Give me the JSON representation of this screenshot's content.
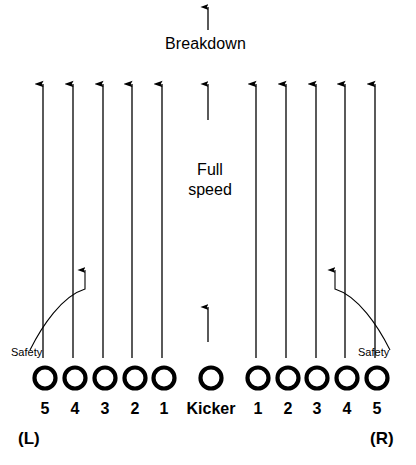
{
  "diagram": {
    "title_text": "Breakdown",
    "center_label_line1": "Full",
    "center_label_line2": "speed",
    "kicker_label": "Kicker",
    "safety_left_label": "Safety",
    "safety_right_label": "Safety",
    "side_left_label": "(L)",
    "side_right_label": "(R)",
    "stroke_color": "#000000",
    "background_color": "#ffffff",
    "players": [
      {
        "label": "5",
        "side": "L",
        "cx": 45,
        "cy": 378
      },
      {
        "label": "4",
        "side": "L",
        "cx": 75,
        "cy": 378
      },
      {
        "label": "3",
        "side": "L",
        "cx": 105,
        "cy": 378
      },
      {
        "label": "2",
        "side": "L",
        "cx": 135,
        "cy": 378
      },
      {
        "label": "1",
        "side": "L",
        "cx": 164,
        "cy": 378
      },
      {
        "label": "Kicker",
        "side": "C",
        "cx": 211,
        "cy": 378
      },
      {
        "label": "1",
        "side": "R",
        "cx": 258,
        "cy": 378
      },
      {
        "label": "2",
        "side": "R",
        "cx": 288,
        "cy": 378
      },
      {
        "label": "3",
        "side": "R",
        "cx": 317,
        "cy": 378
      },
      {
        "label": "4",
        "side": "R",
        "cx": 347,
        "cy": 378
      },
      {
        "label": "5",
        "side": "R",
        "cx": 377,
        "cy": 378
      }
    ],
    "lanes": [
      {
        "name": "lane-L5",
        "x": 43,
        "top": 82,
        "bottom": 358
      },
      {
        "name": "lane-L4",
        "x": 73,
        "top": 82,
        "bottom": 358
      },
      {
        "name": "lane-L3",
        "x": 103,
        "top": 82,
        "bottom": 358
      },
      {
        "name": "lane-L2",
        "x": 132,
        "top": 82,
        "bottom": 358
      },
      {
        "name": "lane-L1",
        "x": 162,
        "top": 82,
        "bottom": 358
      },
      {
        "name": "lane-R1",
        "x": 256,
        "top": 82,
        "bottom": 358
      },
      {
        "name": "lane-R2",
        "x": 286,
        "top": 82,
        "bottom": 358
      },
      {
        "name": "lane-R3",
        "x": 316,
        "top": 82,
        "bottom": 358
      },
      {
        "name": "lane-R4",
        "x": 345,
        "top": 82,
        "bottom": 358
      },
      {
        "name": "lane-R5",
        "x": 375,
        "top": 82,
        "bottom": 358
      }
    ],
    "kicker_arrows": [
      {
        "name": "kicker-arrow-upper",
        "x": 208,
        "top": 82,
        "bottom": 120
      },
      {
        "name": "kicker-arrow-lower",
        "x": 208,
        "top": 305,
        "bottom": 342
      }
    ],
    "breakdown_arrow": {
      "x": 208,
      "top": 5,
      "bottom": 30
    },
    "safety_paths": [
      {
        "name": "safety-path-left",
        "d": "M 30 350 C 40 330 60 296 85 289 L 85 268"
      },
      {
        "name": "safety-path-right",
        "d": "M 390 350 C 380 330 360 296 335 289 L 335 268"
      }
    ]
  }
}
